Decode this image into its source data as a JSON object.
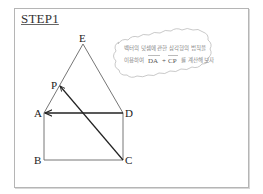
{
  "step_title": "STEP1",
  "note": {
    "line1": "벡터의 덧셈에 관한 삼각형의 법칙을",
    "line2_prefix": "이용하여",
    "vector1": "DA",
    "plus": "+",
    "vector2": "CP",
    "line2_suffix": "를 계산해 보자"
  },
  "points": {
    "E": "E",
    "P": "P",
    "A": "A",
    "D": "D",
    "B": "B",
    "C": "C"
  },
  "colors": {
    "line": "#555555",
    "arrow": "#222222",
    "frame": "#b5b5b5"
  }
}
